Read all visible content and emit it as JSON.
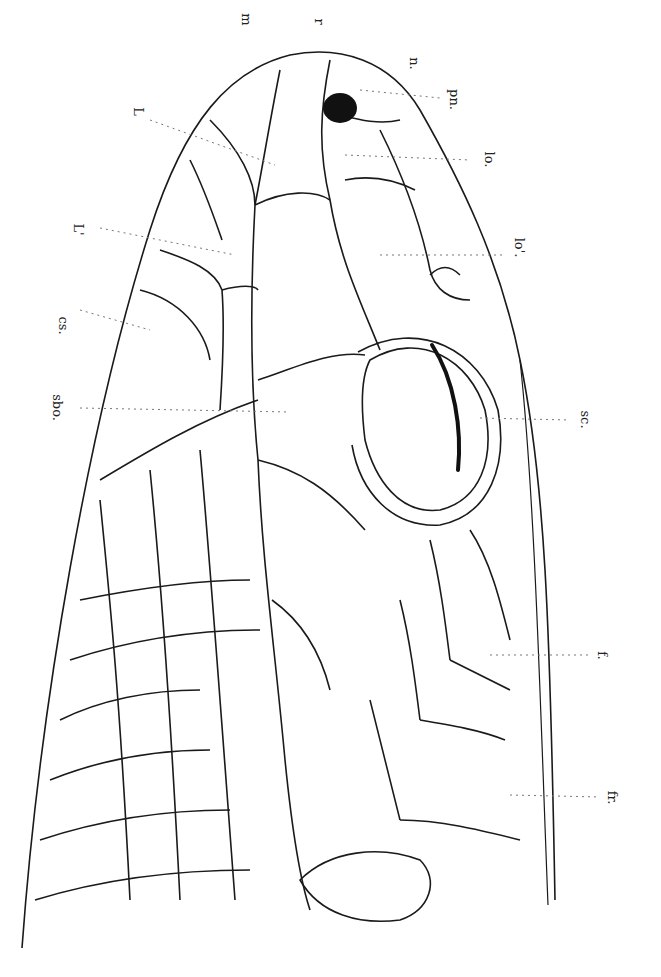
{
  "figure": {
    "labels": [
      {
        "id": "m",
        "text": "m",
        "x": 240,
        "y": 12
      },
      {
        "id": "r",
        "text": "r",
        "x": 316,
        "y": 14
      },
      {
        "id": "n",
        "text": "n.",
        "x": 408,
        "y": 56
      },
      {
        "id": "pn",
        "text": "pn.",
        "x": 446,
        "y": 98
      },
      {
        "id": "lo",
        "text": "lo.",
        "x": 484,
        "y": 158
      },
      {
        "id": "L",
        "text": "L",
        "x": 136,
        "y": 108
      },
      {
        "id": "Lprime",
        "text": "L'",
        "x": 74,
        "y": 226
      },
      {
        "id": "loprime",
        "text": "lo'.",
        "x": 512,
        "y": 244
      },
      {
        "id": "cs",
        "text": "cs.",
        "x": 54,
        "y": 322
      },
      {
        "id": "sbo",
        "text": "sbo.",
        "x": 48,
        "y": 404
      },
      {
        "id": "sc",
        "text": "sc.",
        "x": 576,
        "y": 416
      },
      {
        "id": "f",
        "text": "f.",
        "x": 598,
        "y": 652
      },
      {
        "id": "fr",
        "text": "fr.",
        "x": 608,
        "y": 794
      }
    ],
    "line_color": "#1a1a1a",
    "nostril_color": "#111111"
  }
}
